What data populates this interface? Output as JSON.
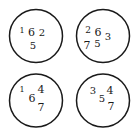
{
  "diagram": {
    "width": 135,
    "height": 137,
    "stroke_color": "#1a1a1a",
    "background": "#ffffff",
    "circles": [
      {
        "cx": 36,
        "cy": 36,
        "r": 26.5,
        "digits": [
          {
            "text": "1",
            "x": 22,
            "y": 30,
            "size": 8
          },
          {
            "text": "6",
            "x": 31.5,
            "y": 32,
            "size": 11
          },
          {
            "text": "2",
            "x": 42,
            "y": 32,
            "size": 10
          },
          {
            "text": "5",
            "x": 33,
            "y": 45,
            "size": 10
          }
        ]
      },
      {
        "cx": 103,
        "cy": 36,
        "r": 26.5,
        "digits": [
          {
            "text": "2",
            "x": 88,
            "y": 30,
            "size": 9
          },
          {
            "text": "6",
            "x": 98,
            "y": 32,
            "size": 11
          },
          {
            "text": "3",
            "x": 108,
            "y": 36,
            "size": 10
          },
          {
            "text": "7",
            "x": 87,
            "y": 45,
            "size": 11
          },
          {
            "text": "5",
            "x": 97.5,
            "y": 43,
            "size": 10
          }
        ]
      },
      {
        "cx": 36,
        "cy": 100.5,
        "r": 26.5,
        "digits": [
          {
            "text": "1",
            "x": 22,
            "y": 89,
            "size": 8
          },
          {
            "text": "4",
            "x": 41,
            "y": 89,
            "size": 11
          },
          {
            "text": "6",
            "x": 32,
            "y": 98,
            "size": 11
          },
          {
            "text": "7",
            "x": 41,
            "y": 107,
            "size": 11
          }
        ]
      },
      {
        "cx": 103,
        "cy": 100.5,
        "r": 26.5,
        "digits": [
          {
            "text": "3",
            "x": 93,
            "y": 90,
            "size": 10
          },
          {
            "text": "5",
            "x": 102,
            "y": 98,
            "size": 10
          },
          {
            "text": "4",
            "x": 110,
            "y": 90,
            "size": 11
          },
          {
            "text": "7",
            "x": 111,
            "y": 106,
            "size": 11
          }
        ]
      }
    ]
  }
}
